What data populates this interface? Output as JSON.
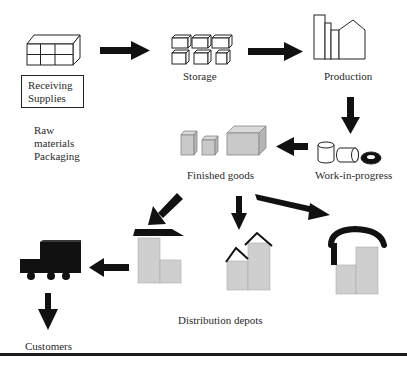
{
  "diagram": {
    "type": "supply-chain-flow",
    "nodes": {
      "receiving": {
        "label_lines": [
          "Receiving",
          "Supplies"
        ],
        "sublabel_lines": [
          "Raw",
          "materials",
          "Packaging"
        ],
        "icon": "crate-grid-icon"
      },
      "storage": {
        "label": "Storage",
        "icon": "stacked-boxes-icon"
      },
      "production": {
        "label": "Production",
        "icon": "factory-icon"
      },
      "work_in_progress": {
        "label": "Work-in-progress",
        "icon": "cylinders-ring-icon"
      },
      "finished_goods": {
        "label": "Finished goods",
        "icon": "gray-boxes-icon"
      },
      "distribution_depots": {
        "label": "Distribution depots",
        "icons": [
          "depot-flat-roof-icon",
          "depot-pitched-roofs-icon",
          "depot-arched-roof-icon"
        ]
      },
      "transport": {
        "icon": "truck-icon"
      },
      "customers": {
        "label": "Customers"
      }
    },
    "edges": [
      {
        "from": "receiving",
        "to": "storage"
      },
      {
        "from": "storage",
        "to": "production"
      },
      {
        "from": "production",
        "to": "work_in_progress"
      },
      {
        "from": "work_in_progress",
        "to": "finished_goods"
      },
      {
        "from": "finished_goods",
        "to": "distribution_depots",
        "count": 3
      },
      {
        "from": "distribution_depots",
        "to": "transport"
      },
      {
        "from": "transport",
        "to": "customers"
      }
    ],
    "colors": {
      "ink": "#111111",
      "fill_gray": "#cfcfcf",
      "fill_gray_dark": "#b5b5b5",
      "text": "#2a2a2a",
      "background": "#ffffff"
    }
  }
}
